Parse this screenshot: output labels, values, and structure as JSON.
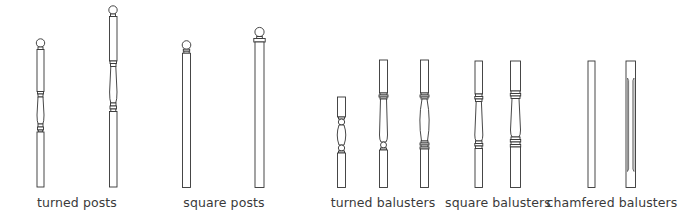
{
  "groups": [
    {
      "id": "turned-posts",
      "label": "turned posts",
      "center_x": 77,
      "count": 2
    },
    {
      "id": "square-posts",
      "label": "square posts",
      "center_x": 224,
      "count": 2
    },
    {
      "id": "turned-balusters",
      "label": "turned balusters",
      "center_x": 383,
      "count": 3
    },
    {
      "id": "square-balusters",
      "label": "square balusters",
      "center_x": 498,
      "count": 2
    },
    {
      "id": "chamfered-balusters",
      "label": "chamfered balusters",
      "center_x": 612,
      "count": 2
    }
  ],
  "style": {
    "stroke": "#333333",
    "fill": "#ffffff",
    "text_color": "#3a3a3a"
  }
}
